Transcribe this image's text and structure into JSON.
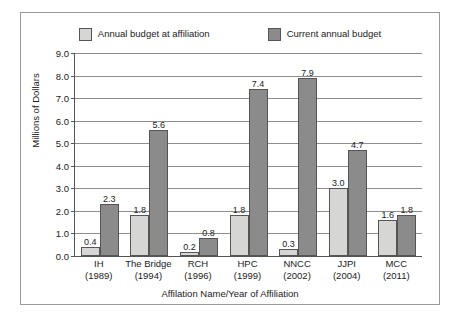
{
  "chart_data": {
    "type": "bar",
    "title": "",
    "xlabel": "Affilation Name/Year of Affiliation",
    "ylabel": "Millions of Dollars",
    "ylim": [
      0.0,
      9.0
    ],
    "ytick_labels": [
      "9.0",
      "8.0",
      "7.0",
      "6.0",
      "5.0",
      "4.0",
      "3.0",
      "2.0",
      "1.0",
      "0.0"
    ],
    "ytick_values": [
      9.0,
      8.0,
      7.0,
      6.0,
      5.0,
      4.0,
      3.0,
      2.0,
      1.0,
      0.0
    ],
    "grid": true,
    "legend_position": "top",
    "categories": [
      {
        "name": "IH",
        "year": "(1989)"
      },
      {
        "name": "The Bridge",
        "year": "(1994)"
      },
      {
        "name": "RCH",
        "year": "(1996)"
      },
      {
        "name": "HPC",
        "year": "(1999)"
      },
      {
        "name": "NNCC",
        "year": "(2002)"
      },
      {
        "name": "JJPI",
        "year": "(2004)"
      },
      {
        "name": "MCC",
        "year": "(2011)"
      }
    ],
    "series": [
      {
        "name": "Annual budget at affiliation",
        "color": "#d6d6d4",
        "values": [
          0.4,
          1.8,
          0.2,
          1.8,
          0.3,
          3.0,
          1.6
        ],
        "labels": [
          "0.4",
          "1.8",
          "0.2",
          "1.8",
          "0.3",
          "3.0",
          "1.6"
        ]
      },
      {
        "name": "Current annual budget",
        "color": "#8b8b8b",
        "values": [
          2.3,
          5.6,
          0.8,
          7.4,
          7.9,
          4.7,
          1.8
        ],
        "labels": [
          "2.3",
          "5.6",
          "0.8",
          "7.4",
          "7.9",
          "4.7",
          "1.8"
        ]
      }
    ]
  },
  "legend": {
    "entries": [
      {
        "label": "Annual budget at affiliation",
        "swatch": "light-gray-swatch"
      },
      {
        "label": "Current annual budget",
        "swatch": "dark-gray-swatch"
      }
    ]
  },
  "colors": {
    "light_bar": "#d6d6d4",
    "dark_bar": "#8b8b8b",
    "outline": "#555555",
    "gridline": "#8d8d8d",
    "frame": "#9a9a9a",
    "text": "#1a1a1a",
    "background": "#ffffff"
  }
}
